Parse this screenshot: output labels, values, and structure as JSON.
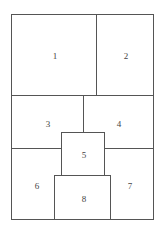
{
  "diagram": {
    "type": "floor-plan-regions",
    "stroke_color": "#555555",
    "regions": [
      {
        "id": "1",
        "label": "1",
        "x": 55,
        "y": 56
      },
      {
        "id": "2",
        "label": "2",
        "x": 126,
        "y": 56
      },
      {
        "id": "3",
        "label": "3",
        "x": 48,
        "y": 124
      },
      {
        "id": "4",
        "label": "4",
        "x": 119,
        "y": 124
      },
      {
        "id": "5",
        "label": "5",
        "x": 84,
        "y": 155
      },
      {
        "id": "6",
        "label": "6",
        "x": 37,
        "y": 187
      },
      {
        "id": "7",
        "label": "7",
        "x": 130,
        "y": 187
      },
      {
        "id": "8",
        "label": "8",
        "x": 84,
        "y": 199
      }
    ]
  }
}
